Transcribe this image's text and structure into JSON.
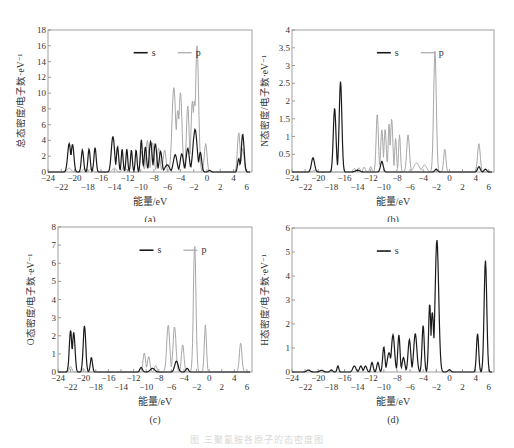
{
  "figure": {
    "caption": "图 三聚氰胺各原子的态密度图",
    "colors": {
      "s": "#1a1a1a",
      "p": "#a8a8a8",
      "frame": "#888888",
      "text": "#333333"
    }
  },
  "chart_data": [
    {
      "id": "a",
      "type": "line",
      "title": "",
      "panel_label": "(a)",
      "xlabel": "能量/eV",
      "ylabel": "总态密度/电子数·eV⁻¹",
      "xlim": [
        -24,
        6.8
      ],
      "ylim": [
        0,
        18
      ],
      "yticks": [
        0,
        2,
        4,
        6,
        8,
        10,
        12,
        14,
        16,
        18
      ],
      "xticks_upper": [
        -24,
        -20,
        -16,
        -12,
        -8,
        -4,
        0,
        4
      ],
      "xticks_lower": [
        -22,
        -18,
        -14,
        -10,
        -6,
        -2,
        2,
        6
      ],
      "legend": [
        "s",
        "p"
      ],
      "grid": false,
      "series": [
        {
          "name": "s",
          "peaks": [
            [
              -20.8,
              3.6,
              0.35
            ],
            [
              -20.3,
              3.5,
              0.3
            ],
            [
              -18.8,
              2.8,
              0.25
            ],
            [
              -17.8,
              2.9,
              0.25
            ],
            [
              -16.9,
              3.1,
              0.25
            ],
            [
              -14.2,
              4.5,
              0.35
            ],
            [
              -13.5,
              3.2,
              0.25
            ],
            [
              -12.8,
              2.9,
              0.2
            ],
            [
              -12.1,
              2.9,
              0.2
            ],
            [
              -11.4,
              2.8,
              0.2
            ],
            [
              -10.7,
              2.8,
              0.2
            ],
            [
              -9.9,
              4.1,
              0.22
            ],
            [
              -9.3,
              3.2,
              0.25
            ],
            [
              -8.5,
              3.9,
              0.3
            ],
            [
              -7.8,
              3.6,
              0.3
            ],
            [
              -7.0,
              2.6,
              0.3
            ],
            [
              -6.0,
              0.9,
              0.5
            ],
            [
              -4.8,
              2.2,
              0.4
            ],
            [
              -3.8,
              2.3,
              0.35
            ],
            [
              -2.9,
              3.0,
              0.35
            ],
            [
              -1.8,
              5.4,
              0.45
            ],
            [
              -1.0,
              2.5,
              0.3
            ],
            [
              0.4,
              0.2,
              0.3
            ],
            [
              4.8,
              1.7,
              0.25
            ],
            [
              5.4,
              4.8,
              0.3
            ]
          ]
        },
        {
          "name": "p",
          "peaks": [
            [
              -20.8,
              0.5,
              0.4
            ],
            [
              -18.5,
              0.4,
              0.4
            ],
            [
              -17.5,
              0.4,
              0.4
            ],
            [
              -14.0,
              0.5,
              0.4
            ],
            [
              -12.5,
              0.7,
              0.4
            ],
            [
              -9.9,
              2.6,
              0.3
            ],
            [
              -9.0,
              4.0,
              0.3
            ],
            [
              -8.2,
              3.7,
              0.3
            ],
            [
              -7.3,
              3.0,
              0.3
            ],
            [
              -6.4,
              2.8,
              0.3
            ],
            [
              -5.0,
              10.7,
              0.4
            ],
            [
              -4.0,
              10.1,
              0.35
            ],
            [
              -4.4,
              7.8,
              0.4
            ],
            [
              -2.9,
              8.4,
              0.3
            ],
            [
              -2.2,
              9.0,
              0.3
            ],
            [
              -1.5,
              16.0,
              0.35
            ],
            [
              -1.9,
              9.0,
              0.35
            ],
            [
              -0.2,
              3.6,
              0.3
            ],
            [
              4.8,
              5.0,
              0.3
            ],
            [
              5.4,
              3.0,
              0.3
            ]
          ]
        }
      ]
    },
    {
      "id": "b",
      "type": "line",
      "title": "",
      "panel_label": "(b)",
      "xlabel": "能量/eV",
      "ylabel": "N态密度/电子数·eV⁻¹",
      "xlim": [
        -24,
        6.8
      ],
      "ylim": [
        0,
        4.0
      ],
      "yticks": [
        0,
        0.5,
        1.0,
        1.5,
        2.0,
        2.5,
        3.0,
        3.5,
        4.0
      ],
      "xticks_upper": [
        -24,
        -20,
        -16,
        -12,
        -8,
        -4,
        0,
        4
      ],
      "xticks_lower": [
        -22,
        -18,
        -14,
        -10,
        -6,
        -2,
        2,
        6
      ],
      "legend": [
        "s",
        "p"
      ],
      "grid": false,
      "series": [
        {
          "name": "s",
          "peaks": [
            [
              -20.8,
              0.4,
              0.35
            ],
            [
              -17.5,
              1.8,
              0.3
            ],
            [
              -16.6,
              2.55,
              0.3
            ],
            [
              -14.0,
              0.05,
              0.5
            ],
            [
              -10.3,
              0.3,
              0.3
            ],
            [
              -2.0,
              0.08,
              0.3
            ],
            [
              4.5,
              0.15,
              0.3
            ],
            [
              5.5,
              0.08,
              0.3
            ]
          ]
        },
        {
          "name": "p",
          "peaks": [
            [
              -20.5,
              0.05,
              0.4
            ],
            [
              -14.5,
              0.1,
              0.3
            ],
            [
              -13.8,
              0.12,
              0.25
            ],
            [
              -13.0,
              0.14,
              0.25
            ],
            [
              -12.0,
              0.15,
              0.25
            ],
            [
              -11.0,
              1.65,
              0.25
            ],
            [
              -10.3,
              1.2,
              0.25
            ],
            [
              -9.8,
              1.2,
              0.25
            ],
            [
              -9.2,
              1.35,
              0.2
            ],
            [
              -8.8,
              1.5,
              0.25
            ],
            [
              -8.2,
              0.95,
              0.2
            ],
            [
              -7.6,
              1.05,
              0.2
            ],
            [
              -6.3,
              1.05,
              0.3
            ],
            [
              -5.0,
              0.25,
              0.6
            ],
            [
              -3.8,
              0.2,
              0.5
            ],
            [
              -2.2,
              3.4,
              0.3
            ],
            [
              -0.7,
              0.65,
              0.25
            ],
            [
              4.5,
              0.8,
              0.3
            ]
          ]
        }
      ]
    },
    {
      "id": "c",
      "type": "line",
      "title": "",
      "panel_label": "(c)",
      "xlabel": "能量/eV",
      "ylabel": "O态密度/电子数·eV⁻¹",
      "xlim": [
        -24,
        6.8
      ],
      "ylim": [
        0,
        8
      ],
      "yticks": [
        0,
        1,
        2,
        3,
        4,
        5,
        6,
        7,
        8
      ],
      "xticks_upper": [
        -24,
        -20,
        -16,
        -12,
        -8,
        -4,
        0,
        4
      ],
      "xticks_lower": [
        -22,
        -18,
        -14,
        -10,
        -6,
        -2,
        2,
        6
      ],
      "legend": [
        "s",
        "p"
      ],
      "grid": false,
      "series": [
        {
          "name": "s",
          "peaks": [
            [
              -22.0,
              2.3,
              0.3
            ],
            [
              -21.5,
              2.2,
              0.3
            ],
            [
              -19.8,
              2.55,
              0.3
            ],
            [
              -18.7,
              0.8,
              0.25
            ],
            [
              -10.8,
              0.25,
              0.3
            ],
            [
              -9.0,
              0.2,
              0.5
            ],
            [
              -5.2,
              0.6,
              0.4
            ],
            [
              -3.5,
              0.2,
              0.3
            ]
          ]
        },
        {
          "name": "p",
          "peaks": [
            [
              -22.0,
              0.3,
              0.3
            ],
            [
              -20.0,
              0.2,
              0.3
            ],
            [
              -10.3,
              1.05,
              0.3
            ],
            [
              -9.6,
              0.85,
              0.3
            ],
            [
              -8.5,
              0.35,
              0.3
            ],
            [
              -6.5,
              2.6,
              0.35
            ],
            [
              -5.5,
              2.5,
              0.35
            ],
            [
              -4.2,
              1.5,
              0.3
            ],
            [
              -2.3,
              7.0,
              0.3
            ],
            [
              -0.6,
              2.6,
              0.25
            ],
            [
              5.0,
              1.6,
              0.3
            ]
          ]
        }
      ]
    },
    {
      "id": "d",
      "type": "line",
      "title": "",
      "panel_label": "(d)",
      "xlabel": "能量/eV",
      "ylabel": "H态密度/电子数·eV⁻¹",
      "xlim": [
        -24,
        6.8
      ],
      "ylim": [
        0,
        6
      ],
      "yticks": [
        0,
        1,
        2,
        3,
        4,
        5,
        6
      ],
      "xticks_upper": [
        -24,
        -20,
        -16,
        -12,
        -8,
        -4,
        0,
        4
      ],
      "xticks_lower": [
        -22,
        -18,
        -14,
        -10,
        -6,
        -2,
        2,
        6
      ],
      "legend": [
        "s"
      ],
      "grid": false,
      "series": [
        {
          "name": "s",
          "peaks": [
            [
              -21.5,
              0.08,
              0.4
            ],
            [
              -19.5,
              0.07,
              0.4
            ],
            [
              -18.0,
              0.08,
              0.3
            ],
            [
              -17.0,
              0.25,
              0.2
            ],
            [
              -14.5,
              0.25,
              0.35
            ],
            [
              -13.5,
              0.25,
              0.3
            ],
            [
              -12.8,
              0.25,
              0.3
            ],
            [
              -11.8,
              0.4,
              0.25
            ],
            [
              -10.9,
              0.4,
              0.25
            ],
            [
              -10.0,
              1.05,
              0.25
            ],
            [
              -9.2,
              0.8,
              0.4
            ],
            [
              -8.6,
              1.55,
              0.35
            ],
            [
              -7.7,
              1.55,
              0.25
            ],
            [
              -7.0,
              0.6,
              0.3
            ],
            [
              -6.1,
              1.35,
              0.3
            ],
            [
              -5.2,
              1.6,
              0.35
            ],
            [
              -4.0,
              1.95,
              0.25
            ],
            [
              -3.0,
              2.85,
              0.25
            ],
            [
              -2.6,
              2.5,
              0.3
            ],
            [
              -1.9,
              5.5,
              0.4
            ],
            [
              0.0,
              0.1,
              0.3
            ],
            [
              4.3,
              1.6,
              0.25
            ],
            [
              5.5,
              4.65,
              0.3
            ]
          ]
        }
      ]
    }
  ],
  "panels": [
    {
      "id": "a",
      "label": "(a)",
      "xlabel": "能量/eV",
      "ylabel": "总态密度/电子数·eV⁻¹",
      "legend_s": "s",
      "legend_p": "p"
    },
    {
      "id": "b",
      "label": "(b)",
      "xlabel": "能量/eV",
      "ylabel": "N态密度/电子数·eV⁻¹",
      "legend_s": "s",
      "legend_p": "p"
    },
    {
      "id": "c",
      "label": "(c)",
      "xlabel": "能量/eV",
      "ylabel": "O态密度/电子数·eV⁻¹",
      "legend_s": "s",
      "legend_p": "p"
    },
    {
      "id": "d",
      "label": "(d)",
      "xlabel": "能量/eV",
      "ylabel": "H态密度/电子数·eV⁻¹",
      "legend_s": "s"
    }
  ]
}
